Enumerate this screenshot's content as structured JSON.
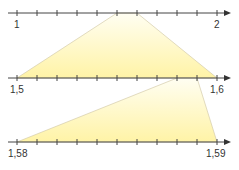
{
  "diagram": {
    "colors": {
      "axis": "#333333",
      "fill": "#fff6b0",
      "fill_edge": "#ffffe8",
      "edge": "#c8c0a0"
    },
    "lines": [
      {
        "start_label": "1",
        "end_label": "2"
      },
      {
        "start_label": "1,5",
        "end_label": "1,6"
      },
      {
        "start_label": "1,58",
        "end_label": "1,59"
      }
    ]
  }
}
